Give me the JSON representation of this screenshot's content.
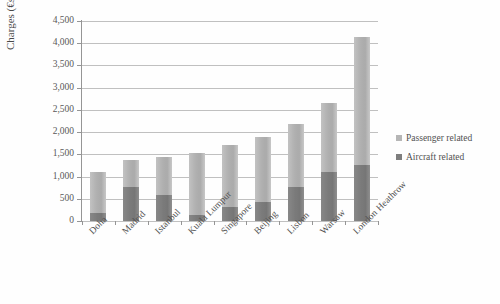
{
  "chart_data": {
    "type": "bar",
    "stacked": true,
    "title": "",
    "xlabel": "",
    "ylabel": "Charges (€s)",
    "ylim": [
      0,
      4500
    ],
    "ytick_step": 500,
    "ytick_labels": [
      "4,500",
      "4,000",
      "3,500",
      "3,000",
      "2,500",
      "2,000",
      "1,500",
      "1,000",
      "500",
      "0"
    ],
    "ytick_values": [
      4500,
      4000,
      3500,
      3000,
      2500,
      2000,
      1500,
      1000,
      500,
      0
    ],
    "grid": "horizontal",
    "legend_position": "right",
    "categories": [
      "Doha",
      "Madrid",
      "Istanbul",
      "Kuala Lumpur",
      "Singapore",
      "Beijing",
      "Lisbon",
      "Warsaw",
      "London Heathrow"
    ],
    "series": [
      {
        "name": "Aircraft related",
        "color": "#636363",
        "values": [
          175,
          775,
          575,
          125,
          325,
          425,
          775,
          1100,
          1250
        ]
      },
      {
        "name": "Passenger related",
        "color": "#a8a8a8",
        "values": [
          925,
          600,
          875,
          1400,
          1375,
          1475,
          1400,
          1550,
          2900
        ]
      }
    ],
    "totals": [
      1100,
      1375,
      1450,
      1525,
      1700,
      1900,
      2175,
      2650,
      4150
    ]
  },
  "legend": {
    "items": [
      {
        "label": "Passenger related",
        "swatch_class": "sw-passenger"
      },
      {
        "label": "Aircraft related",
        "swatch_class": "sw-aircraft"
      }
    ]
  }
}
